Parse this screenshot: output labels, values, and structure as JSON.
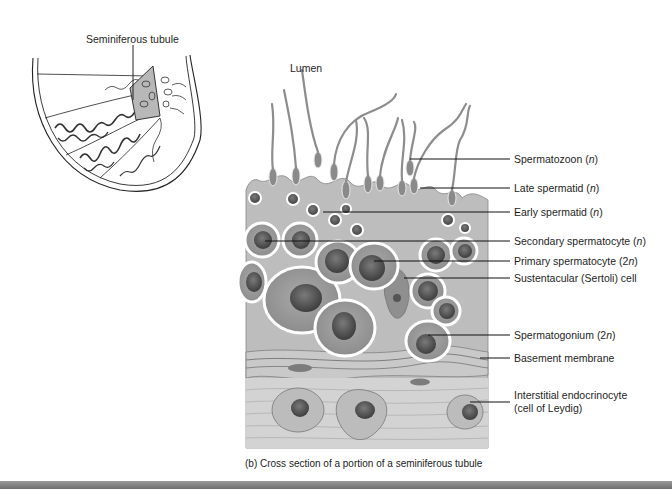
{
  "inset": {
    "label": "Seminiferous tubule"
  },
  "main": {
    "lumen_label": "Lumen",
    "callouts": [
      {
        "text": "Spermatozoon (",
        "ploidy": "n",
        "close": ")",
        "y": 159
      },
      {
        "text": "Late spermatid (",
        "ploidy": "n",
        "close": ")",
        "y": 188
      },
      {
        "text": "Early spermatid (",
        "ploidy": "n",
        "close": ")",
        "y": 212
      },
      {
        "text": "Secondary spermatocyte (",
        "ploidy": "n",
        "close": ")",
        "y": 241
      },
      {
        "text": "Primary spermatocyte (2",
        "ploidy": "n",
        "close": ")",
        "y": 261
      },
      {
        "text": "Sustentacular (Sertoli) cell",
        "ploidy": "",
        "close": "",
        "y": 278
      },
      {
        "text": "Spermatogonium (2",
        "ploidy": "n",
        "close": ")",
        "y": 335
      },
      {
        "text": "Basement membrane",
        "ploidy": "",
        "close": "",
        "y": 358
      },
      {
        "text": "Interstitial endocrinocyte",
        "ploidy": "",
        "close": "",
        "y": 395
      },
      {
        "text": "(cell of Leydig)",
        "ploidy": "",
        "close": "",
        "y": 408
      }
    ],
    "caption": "(b) Cross section of a portion of a seminiferous tubule"
  },
  "colors": {
    "tissue": "#b9b9b9",
    "tissue_dark": "#8c8c8c",
    "nucleus": "#555555",
    "line": "#111111"
  }
}
